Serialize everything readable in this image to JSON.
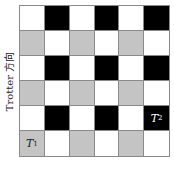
{
  "diagram": {
    "y_axis_label": "Trotter 方向",
    "rows": 6,
    "cols": 6,
    "colors": {
      "w": "#ffffff",
      "b": "#000000",
      "g": "#c4c4c4",
      "grid_line": "#8a8a8a"
    },
    "cells": [
      [
        "w",
        "b",
        "w",
        "b",
        "w",
        "b"
      ],
      [
        "g",
        "w",
        "g",
        "w",
        "g",
        "w"
      ],
      [
        "w",
        "b",
        "w",
        "b",
        "w",
        "b"
      ],
      [
        "g",
        "w",
        "g",
        "w",
        "g",
        "w"
      ],
      [
        "w",
        "b",
        "w",
        "b",
        "w",
        "b"
      ],
      [
        "g",
        "w",
        "g",
        "w",
        "g",
        "w"
      ]
    ],
    "labels": [
      {
        "row": 5,
        "col": 0,
        "text": "T",
        "sub": "1"
      },
      {
        "row": 4,
        "col": 5,
        "text": "T",
        "sub": "2"
      }
    ]
  }
}
